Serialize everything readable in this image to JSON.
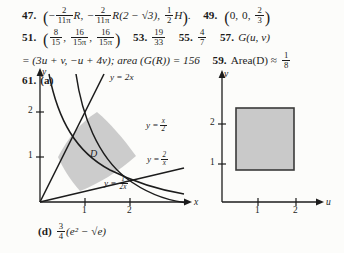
{
  "page": {
    "type": "textbook-answer-key",
    "background": "#fcfcfa",
    "ink": "#1c1c1c"
  },
  "answers": [
    {
      "id": "line-1",
      "items": [
        {
          "number": "47.",
          "answer_parts": [
            {
              "kind": "open-paren",
              "text": "("
            },
            {
              "kind": "sign",
              "text": "−"
            },
            {
              "kind": "fraction",
              "numerator": "2",
              "denominator": "11π"
            },
            {
              "kind": "var",
              "text": "R"
            },
            {
              "kind": "comma",
              "text": ","
            },
            {
              "kind": "sign",
              "text": "−"
            },
            {
              "kind": "fraction",
              "numerator": "2",
              "denominator": "11π"
            },
            {
              "kind": "expr",
              "text": "R(2 − √3)"
            },
            {
              "kind": "comma",
              "text": ","
            },
            {
              "kind": "fraction",
              "numerator": "1",
              "denominator": "2"
            },
            {
              "kind": "var",
              "text": "H"
            },
            {
              "kind": "close-paren",
              "text": ")"
            },
            {
              "kind": "period",
              "text": "."
            }
          ]
        },
        {
          "number": "49.",
          "answer_parts": [
            {
              "kind": "open-paren",
              "text": "("
            },
            {
              "kind": "num",
              "text": "0,"
            },
            {
              "kind": "num",
              "text": "0,"
            },
            {
              "kind": "fraction",
              "numerator": "2",
              "denominator": "3"
            },
            {
              "kind": "close-paren",
              "text": ")"
            }
          ]
        }
      ]
    },
    {
      "id": "line-2",
      "items": [
        {
          "number": "51.",
          "answer_parts": [
            {
              "kind": "open-paren",
              "text": "("
            },
            {
              "kind": "fraction",
              "numerator": "8",
              "denominator": "15"
            },
            {
              "kind": "comma",
              "text": ","
            },
            {
              "kind": "fraction",
              "numerator": "16",
              "denominator": "15π"
            },
            {
              "kind": "comma",
              "text": ","
            },
            {
              "kind": "fraction",
              "numerator": "16",
              "denominator": "15π"
            },
            {
              "kind": "close-paren",
              "text": ")"
            }
          ]
        },
        {
          "number": "53.",
          "answer_parts": [
            {
              "kind": "fraction",
              "numerator": "19",
              "denominator": "33"
            }
          ]
        },
        {
          "number": "55.",
          "answer_parts": [
            {
              "kind": "fraction",
              "numerator": "4",
              "denominator": "7"
            }
          ]
        },
        {
          "number": "57.",
          "answer_parts": [
            {
              "kind": "func",
              "text": "G(u, v)"
            }
          ]
        }
      ]
    },
    {
      "id": "line-3",
      "continuation": "= (3u + v,  −u + 4v); area (G(R)) = 156",
      "items": [
        {
          "number": "59.",
          "answer_parts": [
            {
              "kind": "text",
              "text": "Area(D) ≈"
            },
            {
              "kind": "fraction",
              "numerator": "1",
              "denominator": "8"
            }
          ]
        }
      ]
    }
  ],
  "problem_61": {
    "number": "61.",
    "part_label": "(a)",
    "left_figure": {
      "name": "xy-plane-region-D",
      "x_axis_label": "x",
      "y_axis_label": "y",
      "x_ticks": [
        "1",
        "2"
      ],
      "y_ticks": [
        "1",
        "2"
      ],
      "region_label": "D",
      "curves": [
        {
          "name": "y-equals-2x",
          "label_lhs": "y = 2x",
          "numerator": "",
          "denominator": ""
        },
        {
          "name": "y-equals-x-over-2",
          "label_lhs": "y =",
          "numerator": "x",
          "denominator": "2"
        },
        {
          "name": "y-equals-2-over-x",
          "label_lhs": "y =",
          "numerator": "2",
          "denominator": "x"
        },
        {
          "name": "y-equals-1-over-2x",
          "label_lhs": "y =",
          "numerator": "1",
          "denominator": "2x"
        }
      ]
    },
    "right_figure": {
      "name": "uv-plane-rectangle",
      "u_axis_label": "u",
      "v_axis_label": "v",
      "u_ticks": [
        "1",
        "2"
      ],
      "v_ticks": [
        "1",
        "2"
      ],
      "shape": "filled-rectangle",
      "fill_color": "#c4c4c4"
    }
  },
  "part_d": {
    "label": "(d)",
    "expression_numerator": "3",
    "expression_denominator": "4",
    "expression_body": "(e² − √e)"
  }
}
